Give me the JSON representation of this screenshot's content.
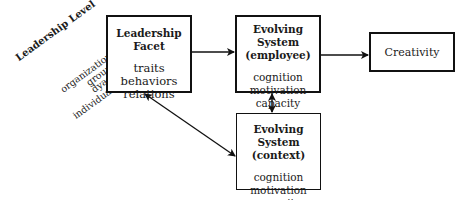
{
  "leadership_level": {
    "title": "Leadership Level",
    "levels": [
      "organization",
      "group",
      "dyad",
      "individual"
    ]
  },
  "leadership_facet": {
    "title": "Leadership Facet",
    "items": [
      "traits",
      "behaviors",
      "relations"
    ]
  },
  "evolving_employee": {
    "title_line1": "Evolving System",
    "title_line2": "(employee)",
    "items": [
      "cognition",
      "motivation",
      "capacity"
    ]
  },
  "evolving_context": {
    "title_line1": "Evolving System",
    "title_line2": "(context)",
    "items": [
      "cognition",
      "motivation",
      "capacity"
    ]
  },
  "creativity": {
    "label": "Creativity"
  },
  "connections": [
    {
      "from": "leadership_facet",
      "to": "evolving_employee",
      "type": "directed"
    },
    {
      "from": "evolving_employee",
      "to": "creativity",
      "type": "directed"
    },
    {
      "from": "evolving_employee",
      "to": "evolving_context",
      "type": "bidirectional"
    },
    {
      "from": "leadership_facet",
      "to": "evolving_context",
      "type": "bidirectional"
    }
  ]
}
